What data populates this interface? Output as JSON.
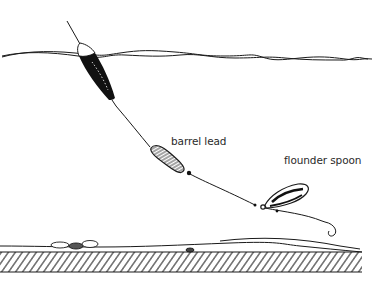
{
  "diagram": {
    "labels": {
      "barrel_lead": "barrel lead",
      "flounder_spoon": "flounder spoon"
    },
    "components": [
      {
        "name": "float",
        "description": "dark elongated float at water surface"
      },
      {
        "name": "water-surface",
        "description": "wavy double line"
      },
      {
        "name": "fishing-line",
        "description": "line from float down to spoon"
      },
      {
        "name": "barrel-lead",
        "description": "hatched cylindrical sinker"
      },
      {
        "name": "flounder-spoon",
        "description": "oval spoon lure"
      },
      {
        "name": "hook",
        "description": "hook at end of leader"
      },
      {
        "name": "seabed",
        "description": "hatched sea floor with pebbles"
      }
    ],
    "colors": {
      "ink": "#1a1a1a",
      "background": "#ffffff"
    }
  }
}
